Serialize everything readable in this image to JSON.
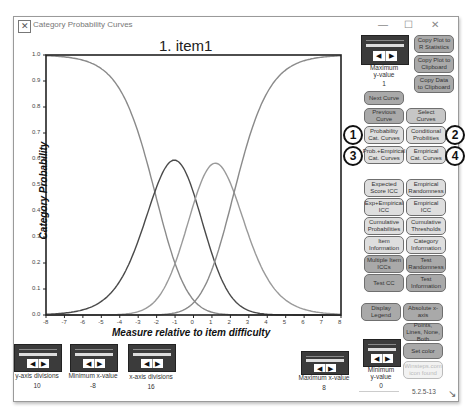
{
  "window": {
    "title": "Category Probability Curves",
    "title_icon": "chart-app-icon",
    "controls": {
      "minimize": "—",
      "maximize": "☐",
      "close": "✕"
    }
  },
  "chart_data": {
    "type": "line",
    "title": "1. item1",
    "xlabel": "Measure relative to item difficulty",
    "ylabel": "Category Probability",
    "xlim": [
      -8,
      8
    ],
    "ylim": [
      0,
      1
    ],
    "x_ticks": [
      "-8",
      "-7",
      "-6",
      "-5",
      "-4",
      "-3",
      "-2",
      "-1",
      "0",
      "1",
      "2",
      "3",
      "4",
      "5",
      "6",
      "7",
      "8"
    ],
    "y_ticks": [
      "0.0",
      "0.1",
      "0.2",
      "0.3",
      "0.4",
      "0.5",
      "0.6",
      "0.7",
      "0.8",
      "0.9",
      "1.0"
    ],
    "thresholds": [
      -2.1,
      0.1,
      2.2
    ],
    "series": [
      {
        "name": "Category 1",
        "color": "#8a8a8a",
        "peak_x": -8,
        "peak_y": 1.0
      },
      {
        "name": "Category 2",
        "color": "#4a4a4a",
        "peak_x": -1.0,
        "peak_y": 0.58
      },
      {
        "name": "Category 3",
        "color": "#9a9a9a",
        "peak_x": 1.2,
        "peak_y": 0.56
      },
      {
        "name": "Category 4",
        "color": "#8a8a8a",
        "peak_x": 8,
        "peak_y": 1.0
      }
    ],
    "grid": false,
    "legend": "none"
  },
  "right_panel": {
    "max_y_slider": {
      "label_line1": "Maximum",
      "label_line2": "y-value",
      "value": "1"
    },
    "copy_plot_r": "Copy Plot to R Statistics",
    "copy_plot_clip": "Copy Plot to Clipboard",
    "copy_data_clip": "Copy Data to Clipboard",
    "next_curve": "Next Curve",
    "previous_curve": "Previous Curve",
    "select_curves": "Select Curves",
    "prob_cat_curves": "Probability Cat. Curves",
    "conditional_probs": "Conditional Probilities",
    "prob_empirical": "Prob.+Empirical Cat. Curves",
    "empirical_cat": "Empirical Cat. Curves",
    "badges": [
      "1",
      "2",
      "3",
      "4"
    ],
    "expected_score_icc": "Expected Score ICC",
    "empirical_randomness": "Empirical Randomness",
    "exp_empirical_icc": "Exp+Empirical ICC",
    "empirical_icc": "Empirical ICC",
    "cumulative_probs": "Cumulative Probabilities",
    "cumulative_thresholds": "Cumulative Thresholds",
    "item_information": "Item Information",
    "category_information": "Category Information",
    "multiple_item_iccs": "Multiple Item ICCs",
    "test_randomness": "Test Randomness",
    "test_cc": "Test CC",
    "test_information": "Test Information",
    "display_legend": "Display Legend",
    "absolute_x_axis": "Absolute x-axis",
    "points_lines": "Points, Lines, None, Both",
    "set_color": "Set color",
    "winsteps_icon_found": "Winsteps.com icon found",
    "min_y_slider": {
      "label_line1": "Minimum",
      "label_line2": "y-value",
      "value": "0"
    },
    "version": "5.2.5-13"
  },
  "bottom_sliders": [
    {
      "label": "y-axis divisions",
      "value": "10"
    },
    {
      "label": "Minimum x-value",
      "value": "-8"
    },
    {
      "label": "x-axis divisions",
      "value": "16"
    },
    {
      "label": "Maximum x-value",
      "value": "8"
    }
  ],
  "slider_arrows": {
    "left": "◀",
    "right": "▶"
  }
}
